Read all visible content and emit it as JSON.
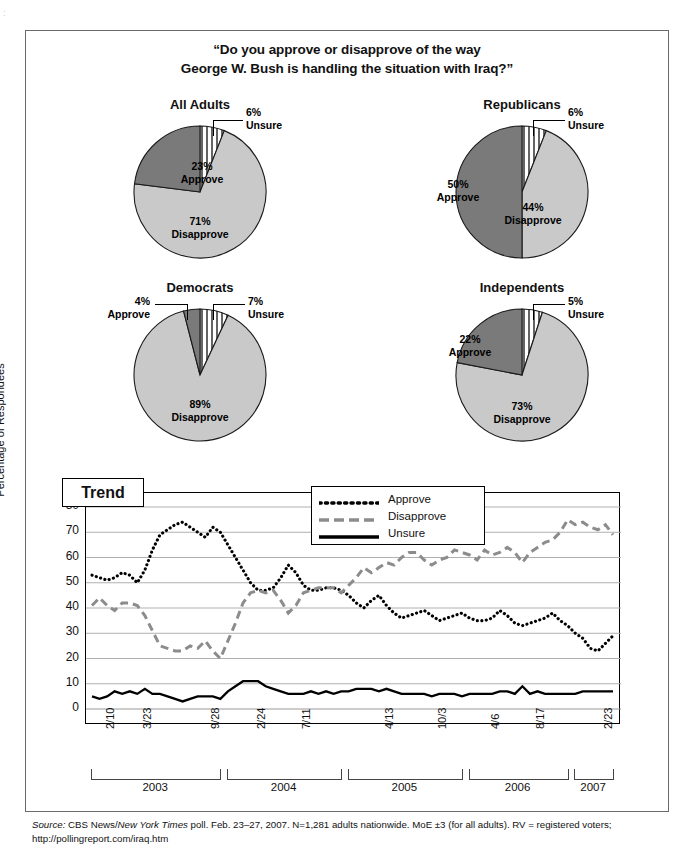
{
  "page": {
    "title_line1": "“Do you approve or disapprove of the way",
    "title_line2": "George W. Bush is handling the situation with Iraq?”",
    "source_prefix": "Source:",
    "source_a": " CBS News/",
    "source_b": "New York Times",
    "source_c": " poll. Feb. 23–27, 2007. N=1,281 adults nationwide. MoE ±3 (for all adults). RV = registered voters;",
    "source_url": "http://pollingreport.com/iraq.htm"
  },
  "colors": {
    "approve": "#7a7a7a",
    "disapprove": "#c9c9c9",
    "unsure": "#ffffff",
    "stroke": "#1a1a1a",
    "grid": "#b0b0b0"
  },
  "pies": [
    {
      "name": "all-adults",
      "title": "All Adults",
      "slices": [
        {
          "label": "Unsure",
          "value": 6,
          "pct": "6%",
          "fill": "stripe"
        },
        {
          "label": "Disapprove",
          "value": 71,
          "pct": "71%",
          "fill": "light"
        },
        {
          "label": "Approve",
          "value": 23,
          "pct": "23%",
          "fill": "dark"
        }
      ]
    },
    {
      "name": "republicans",
      "title": "Republicans",
      "slices": [
        {
          "label": "Unsure",
          "value": 6,
          "pct": "6%",
          "fill": "stripe"
        },
        {
          "label": "Disapprove",
          "value": 44,
          "pct": "44%",
          "fill": "light"
        },
        {
          "label": "Approve",
          "value": 50,
          "pct": "50%",
          "fill": "dark"
        }
      ]
    },
    {
      "name": "democrats",
      "title": "Democrats",
      "slices": [
        {
          "label": "Unsure",
          "value": 7,
          "pct": "7%",
          "fill": "stripe"
        },
        {
          "label": "Disapprove",
          "value": 89,
          "pct": "89%",
          "fill": "light"
        },
        {
          "label": "Approve",
          "value": 4,
          "pct": "4%",
          "fill": "dark"
        }
      ]
    },
    {
      "name": "independents",
      "title": "Independents",
      "slices": [
        {
          "label": "Unsure",
          "value": 5,
          "pct": "5%",
          "fill": "stripe"
        },
        {
          "label": "Disapprove",
          "value": 73,
          "pct": "73%",
          "fill": "light"
        },
        {
          "label": "Approve",
          "value": 22,
          "pct": "22%",
          "fill": "dark"
        }
      ]
    }
  ],
  "trend": {
    "box_label": "Trend",
    "ylabel": "Percentage of Respondees",
    "legend": [
      {
        "label": "Approve",
        "style": "dotted"
      },
      {
        "label": "Disapprove",
        "style": "dashed"
      },
      {
        "label": "Unsure",
        "style": "solid"
      }
    ]
  },
  "chart_data": {
    "type": "line",
    "title": "Trend",
    "xlabel": "",
    "ylabel": "Percentage of Respondees",
    "ylim": [
      0,
      80
    ],
    "yticks": [
      0,
      10,
      20,
      30,
      40,
      50,
      60,
      70,
      80
    ],
    "grid": true,
    "legend_position": "top-right",
    "x_tick_labels": [
      "2/10",
      "3/23",
      "9/28",
      "2/24",
      "7/11",
      "4/13",
      "10/3",
      "4/6",
      "8/17",
      "2/23"
    ],
    "x_tick_indices": [
      1,
      6,
      15,
      21,
      27,
      38,
      45,
      52,
      58,
      67
    ],
    "year_groups": [
      {
        "label": "2003",
        "start": 0,
        "end": 17
      },
      {
        "label": "2004",
        "start": 18,
        "end": 33
      },
      {
        "label": "2005",
        "start": 34,
        "end": 49
      },
      {
        "label": "2006",
        "start": 50,
        "end": 63
      },
      {
        "label": "2007",
        "start": 64,
        "end": 69
      }
    ],
    "series": [
      {
        "name": "Approve",
        "style": "dotted",
        "color": "#000000",
        "values": [
          53,
          52,
          51,
          52,
          54,
          53,
          50,
          55,
          63,
          69,
          71,
          73,
          74,
          72,
          70,
          68,
          72,
          70,
          65,
          60,
          55,
          50,
          47,
          47,
          48,
          52,
          57,
          54,
          49,
          47,
          47,
          48,
          48,
          47,
          45,
          42,
          40,
          43,
          45,
          41,
          38,
          36,
          37,
          38,
          39,
          37,
          35,
          36,
          37,
          38,
          36,
          35,
          35,
          36,
          39,
          37,
          34,
          33,
          34,
          35,
          36,
          38,
          35,
          33,
          30,
          28,
          24,
          23,
          26,
          29
        ]
      },
      {
        "name": "Disapprove",
        "style": "dashed",
        "color": "#8c8c8c",
        "values": [
          41,
          44,
          41,
          39,
          42,
          42,
          41,
          37,
          31,
          25,
          24,
          23,
          23,
          25,
          24,
          27,
          23,
          20,
          27,
          34,
          42,
          46,
          47,
          46,
          47,
          43,
          38,
          41,
          46,
          47,
          48,
          48,
          48,
          46,
          49,
          52,
          56,
          54,
          56,
          58,
          57,
          60,
          62,
          62,
          59,
          57,
          59,
          60,
          63,
          62,
          61,
          59,
          63,
          61,
          62,
          64,
          62,
          58,
          62,
          64,
          66,
          67,
          70,
          75,
          73,
          74,
          72,
          71,
          73,
          69
        ]
      },
      {
        "name": "Unsure",
        "style": "solid",
        "color": "#000000",
        "values": [
          5,
          4,
          5,
          7,
          6,
          7,
          6,
          8,
          6,
          6,
          5,
          4,
          3,
          4,
          5,
          5,
          5,
          4,
          7,
          9,
          11,
          11,
          11,
          9,
          8,
          7,
          6,
          6,
          6,
          7,
          6,
          7,
          6,
          7,
          7,
          8,
          8,
          8,
          7,
          8,
          7,
          6,
          6,
          6,
          6,
          5,
          6,
          6,
          6,
          5,
          6,
          6,
          6,
          6,
          7,
          7,
          6,
          9,
          6,
          7,
          6,
          6,
          6,
          6,
          6,
          7,
          7,
          7,
          7,
          7
        ]
      }
    ]
  }
}
